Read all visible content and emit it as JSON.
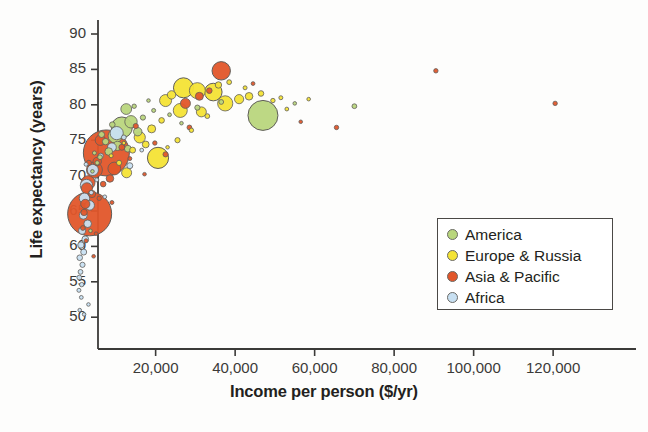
{
  "chart_data": {
    "type": "scatter",
    "title": "",
    "subtitle": "",
    "xlabel": "Income per person ($/yr)",
    "ylabel": "Life expectancy (years)",
    "xlim": [
      0,
      126000
    ],
    "ylim": [
      48,
      92
    ],
    "xticks": [
      20000,
      40000,
      60000,
      80000,
      100000,
      120000
    ],
    "xticklabels": [
      "20,000",
      "40,000",
      "60,000",
      "80,000",
      "100,000",
      "120,000"
    ],
    "yticks": [
      50,
      55,
      60,
      65,
      70,
      75,
      80,
      85,
      90
    ],
    "yticklabels": [
      "50",
      "55",
      "60",
      "65",
      "70",
      "75",
      "80",
      "85",
      "90"
    ],
    "grid": false,
    "legend_position": "lower-right",
    "size_encoding": "population",
    "legend": [
      {
        "label": "America",
        "color": "#b9d67d"
      },
      {
        "label": "Europe & Russia",
        "color": "#f4e335"
      },
      {
        "label": "Asia & Pacific",
        "color": "#e2562a"
      },
      {
        "label": "Africa",
        "color": "#c8e0f2"
      }
    ],
    "series": [
      {
        "name": "America",
        "color": "#b9d67d",
        "points": [
          {
            "x": 47000,
            "y": 78.5,
            "r": 15.0
          },
          {
            "x": 11500,
            "y": 76.8,
            "r": 10.5
          },
          {
            "x": 9800,
            "y": 75.6,
            "r": 7.0
          },
          {
            "x": 13800,
            "y": 77.6,
            "r": 6.2
          },
          {
            "x": 12600,
            "y": 79.4,
            "r": 5.4
          },
          {
            "x": 10400,
            "y": 74.2,
            "r": 4.6
          },
          {
            "x": 15500,
            "y": 76.2,
            "r": 4.2
          },
          {
            "x": 8200,
            "y": 73.4,
            "r": 3.8
          },
          {
            "x": 13000,
            "y": 73.8,
            "r": 3.4
          },
          {
            "x": 7400,
            "y": 74.8,
            "r": 3.2
          },
          {
            "x": 6400,
            "y": 75.8,
            "r": 3.0
          },
          {
            "x": 9100,
            "y": 77.2,
            "r": 2.8
          },
          {
            "x": 16800,
            "y": 78.2,
            "r": 2.6
          },
          {
            "x": 6000,
            "y": 72.6,
            "r": 2.4
          },
          {
            "x": 5300,
            "y": 71.8,
            "r": 2.2
          },
          {
            "x": 14600,
            "y": 79.8,
            "r": 2.2
          },
          {
            "x": 19500,
            "y": 79.2,
            "r": 2.0
          },
          {
            "x": 4600,
            "y": 73.2,
            "r": 2.0
          },
          {
            "x": 23500,
            "y": 78.6,
            "r": 1.9
          },
          {
            "x": 26500,
            "y": 77.4,
            "r": 1.8
          },
          {
            "x": 30500,
            "y": 79.6,
            "r": 2.6
          },
          {
            "x": 4100,
            "y": 70.6,
            "r": 1.8
          },
          {
            "x": 36500,
            "y": 80.4,
            "r": 2.4
          },
          {
            "x": 3600,
            "y": 62.2,
            "r": 1.8
          },
          {
            "x": 70000,
            "y": 79.8,
            "r": 2.4
          },
          {
            "x": 55000,
            "y": 80.2,
            "r": 1.8
          },
          {
            "x": 18200,
            "y": 80.6,
            "r": 1.8
          }
        ]
      },
      {
        "name": "Europe & Russia",
        "color": "#f4e335",
        "points": [
          {
            "x": 27000,
            "y": 82.4,
            "r": 10.0
          },
          {
            "x": 20600,
            "y": 72.5,
            "r": 10.6
          },
          {
            "x": 34500,
            "y": 81.8,
            "r": 8.8
          },
          {
            "x": 30500,
            "y": 82.0,
            "r": 8.0
          },
          {
            "x": 37500,
            "y": 80.2,
            "r": 7.6
          },
          {
            "x": 26200,
            "y": 79.2,
            "r": 7.0
          },
          {
            "x": 22500,
            "y": 80.6,
            "r": 6.0
          },
          {
            "x": 16000,
            "y": 75.4,
            "r": 5.6
          },
          {
            "x": 31500,
            "y": 79.0,
            "r": 5.0
          },
          {
            "x": 12700,
            "y": 70.4,
            "r": 5.0
          },
          {
            "x": 41000,
            "y": 80.8,
            "r": 4.6
          },
          {
            "x": 24000,
            "y": 81.4,
            "r": 4.2
          },
          {
            "x": 19000,
            "y": 76.6,
            "r": 4.0
          },
          {
            "x": 43500,
            "y": 81.2,
            "r": 3.8
          },
          {
            "x": 17500,
            "y": 74.4,
            "r": 3.4
          },
          {
            "x": 35800,
            "y": 82.8,
            "r": 3.2
          },
          {
            "x": 14200,
            "y": 73.6,
            "r": 3.0
          },
          {
            "x": 46500,
            "y": 81.6,
            "r": 2.8
          },
          {
            "x": 21500,
            "y": 77.8,
            "r": 2.8
          },
          {
            "x": 25500,
            "y": 75.0,
            "r": 2.6
          },
          {
            "x": 10800,
            "y": 71.8,
            "r": 2.6
          },
          {
            "x": 38500,
            "y": 83.2,
            "r": 2.4
          },
          {
            "x": 33000,
            "y": 78.4,
            "r": 2.4
          },
          {
            "x": 49500,
            "y": 80.6,
            "r": 2.2
          },
          {
            "x": 29000,
            "y": 76.4,
            "r": 2.2
          },
          {
            "x": 51500,
            "y": 81.0,
            "r": 2.0
          },
          {
            "x": 42500,
            "y": 82.4,
            "r": 2.0
          },
          {
            "x": 8800,
            "y": 72.8,
            "r": 2.0
          },
          {
            "x": 53000,
            "y": 79.4,
            "r": 1.9
          },
          {
            "x": 23000,
            "y": 74.0,
            "r": 1.8
          },
          {
            "x": 58500,
            "y": 80.8,
            "r": 1.8
          },
          {
            "x": 12000,
            "y": 74.6,
            "r": 1.8
          }
        ]
      },
      {
        "name": "Asia & Pacific",
        "color": "#e2562a",
        "points": [
          {
            "x": 7600,
            "y": 73.2,
            "r": 23.0
          },
          {
            "x": 3400,
            "y": 64.6,
            "r": 22.0
          },
          {
            "x": 36500,
            "y": 84.8,
            "r": 9.2
          },
          {
            "x": 4600,
            "y": 70.8,
            "r": 8.0
          },
          {
            "x": 3000,
            "y": 69.0,
            "r": 7.0
          },
          {
            "x": 9600,
            "y": 71.0,
            "r": 6.4
          },
          {
            "x": 2700,
            "y": 68.2,
            "r": 5.6
          },
          {
            "x": 6100,
            "y": 75.0,
            "r": 5.2
          },
          {
            "x": 27500,
            "y": 80.2,
            "r": 5.0
          },
          {
            "x": 2300,
            "y": 66.0,
            "r": 4.6
          },
          {
            "x": 5300,
            "y": 72.0,
            "r": 4.2
          },
          {
            "x": 31000,
            "y": 81.2,
            "r": 4.0
          },
          {
            "x": 8500,
            "y": 69.6,
            "r": 3.8
          },
          {
            "x": 4000,
            "y": 67.4,
            "r": 3.6
          },
          {
            "x": 2000,
            "y": 64.8,
            "r": 3.2
          },
          {
            "x": 11500,
            "y": 74.0,
            "r": 3.0
          },
          {
            "x": 33500,
            "y": 82.0,
            "r": 2.8
          },
          {
            "x": 6800,
            "y": 68.8,
            "r": 2.8
          },
          {
            "x": 3200,
            "y": 71.8,
            "r": 2.6
          },
          {
            "x": 15000,
            "y": 77.0,
            "r": 2.6
          },
          {
            "x": 1700,
            "y": 62.6,
            "r": 2.4
          },
          {
            "x": 28500,
            "y": 76.8,
            "r": 2.4
          },
          {
            "x": 19800,
            "y": 74.6,
            "r": 2.2
          },
          {
            "x": 5800,
            "y": 66.8,
            "r": 2.2
          },
          {
            "x": 22500,
            "y": 73.0,
            "r": 2.6
          },
          {
            "x": 13500,
            "y": 72.4,
            "r": 2.0
          },
          {
            "x": 2500,
            "y": 60.8,
            "r": 2.0
          },
          {
            "x": 9000,
            "y": 66.2,
            "r": 2.0
          },
          {
            "x": 44500,
            "y": 83.0,
            "r": 1.9
          },
          {
            "x": 65500,
            "y": 76.8,
            "r": 2.2
          },
          {
            "x": 90500,
            "y": 84.8,
            "r": 2.2
          },
          {
            "x": 120500,
            "y": 80.2,
            "r": 2.2
          },
          {
            "x": 4400,
            "y": 58.6,
            "r": 1.8
          },
          {
            "x": 56500,
            "y": 77.6,
            "r": 1.8
          },
          {
            "x": 5000,
            "y": 61.8,
            "r": 1.8
          },
          {
            "x": 17200,
            "y": 70.2,
            "r": 1.8
          }
        ]
      },
      {
        "name": "Africa",
        "color": "#c8e0f2",
        "points": [
          {
            "x": 10200,
            "y": 76.0,
            "r": 6.6
          },
          {
            "x": 2600,
            "y": 68.6,
            "r": 6.2
          },
          {
            "x": 4200,
            "y": 70.8,
            "r": 5.6
          },
          {
            "x": 2100,
            "y": 66.8,
            "r": 5.2
          },
          {
            "x": 3400,
            "y": 65.8,
            "r": 4.8
          },
          {
            "x": 9000,
            "y": 74.0,
            "r": 4.4
          },
          {
            "x": 1800,
            "y": 64.4,
            "r": 4.0
          },
          {
            "x": 2900,
            "y": 63.2,
            "r": 3.8
          },
          {
            "x": 1500,
            "y": 62.2,
            "r": 3.6
          },
          {
            "x": 2300,
            "y": 61.0,
            "r": 3.4
          },
          {
            "x": 1200,
            "y": 60.2,
            "r": 3.2
          },
          {
            "x": 1900,
            "y": 59.2,
            "r": 3.0
          },
          {
            "x": 900,
            "y": 58.4,
            "r": 2.8
          },
          {
            "x": 1600,
            "y": 57.4,
            "r": 2.6
          },
          {
            "x": 1100,
            "y": 56.4,
            "r": 2.4
          },
          {
            "x": 6200,
            "y": 72.8,
            "r": 2.6
          },
          {
            "x": 800,
            "y": 55.6,
            "r": 2.4
          },
          {
            "x": 1400,
            "y": 54.6,
            "r": 2.2
          },
          {
            "x": 3800,
            "y": 67.6,
            "r": 2.2
          },
          {
            "x": 700,
            "y": 53.8,
            "r": 2.0
          },
          {
            "x": 5200,
            "y": 69.4,
            "r": 2.0
          },
          {
            "x": 2500,
            "y": 71.6,
            "r": 2.0
          },
          {
            "x": 12000,
            "y": 75.4,
            "r": 2.4
          },
          {
            "x": 1300,
            "y": 52.8,
            "r": 1.9
          },
          {
            "x": 13500,
            "y": 71.4,
            "r": 3.0
          },
          {
            "x": 7200,
            "y": 67.0,
            "r": 1.9
          },
          {
            "x": 3100,
            "y": 51.8,
            "r": 1.8
          },
          {
            "x": 900,
            "y": 51.0,
            "r": 1.8
          },
          {
            "x": 16500,
            "y": 73.6,
            "r": 1.9
          },
          {
            "x": 2000,
            "y": 50.4,
            "r": 1.8
          }
        ]
      }
    ]
  }
}
